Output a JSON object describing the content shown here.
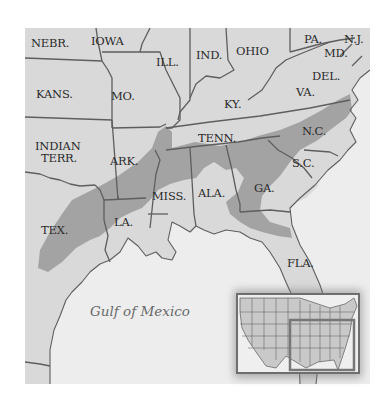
{
  "map": {
    "title": "",
    "colors": {
      "land": "#d9d9d9",
      "water": "#ededed",
      "shaded_region": "#a3a3a3",
      "border": "#5e5e5e",
      "label": "#2b2b2b",
      "water_label": "#6a6a6a",
      "inset_frame": "#6e6e6e"
    },
    "state_labels": [
      {
        "id": "nebr",
        "text": "NEBR."
      },
      {
        "id": "iowa",
        "text": "IOWA"
      },
      {
        "id": "ill",
        "text": "ILL."
      },
      {
        "id": "ind",
        "text": "IND."
      },
      {
        "id": "ohio",
        "text": "OHIO"
      },
      {
        "id": "pa",
        "text": "PA."
      },
      {
        "id": "nj",
        "text": "N.J."
      },
      {
        "id": "md",
        "text": "MD."
      },
      {
        "id": "del",
        "text": "DEL."
      },
      {
        "id": "kans",
        "text": "KANS."
      },
      {
        "id": "mo",
        "text": "MO."
      },
      {
        "id": "ky",
        "text": "KY."
      },
      {
        "id": "va",
        "text": "VA."
      },
      {
        "id": "indian_terr_1",
        "text": "INDIAN"
      },
      {
        "id": "indian_terr_2",
        "text": "TERR."
      },
      {
        "id": "ark",
        "text": "ARK."
      },
      {
        "id": "tenn",
        "text": "TENN."
      },
      {
        "id": "nc",
        "text": "N.C."
      },
      {
        "id": "sc",
        "text": "S.C."
      },
      {
        "id": "miss",
        "text": "MISS."
      },
      {
        "id": "ala",
        "text": "ALA."
      },
      {
        "id": "ga",
        "text": "GA."
      },
      {
        "id": "tex",
        "text": "TEX."
      },
      {
        "id": "la",
        "text": "LA."
      },
      {
        "id": "fla",
        "text": "FLA."
      }
    ],
    "water_labels": [
      {
        "id": "gulf",
        "text": "Gulf of Mexico"
      }
    ],
    "legend_region": "Shaded area across the Southern states (Texas to North Carolina)",
    "inset": {
      "description": "Locator map of the contiguous United States with the southeastern region highlighted"
    }
  }
}
